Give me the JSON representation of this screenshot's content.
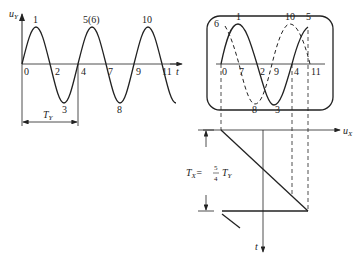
{
  "diagram": {
    "type": "oscilloscope-waveform-display",
    "left_plot": {
      "y_axis_label": "u",
      "y_axis_sub": "Y",
      "x_axis_label": "t",
      "peak_labels": [
        "1",
        "5(6)",
        "10"
      ],
      "trough_labels": [
        "3",
        "8"
      ],
      "zero_labels": [
        "0",
        "2",
        "4",
        "7",
        "9",
        "11"
      ],
      "period_label": "T",
      "period_sub": "Y"
    },
    "screen": {
      "solid_labels_top": [
        "1",
        "5"
      ],
      "dashed_labels_top": [
        "6",
        "10"
      ],
      "axis_labels": [
        "0",
        "7",
        "2",
        "9",
        "4",
        "11"
      ],
      "bottom_labels": [
        "8",
        "3"
      ]
    },
    "sweep": {
      "x_axis_label": "u",
      "x_axis_sub": "X",
      "t_axis_label": "t",
      "formula": {
        "lhs": "T",
        "lhs_sub": "X",
        "eq": "=",
        "num": "5",
        "den": "4",
        "rhs": "T",
        "rhs_sub": "Y"
      }
    },
    "colors": {
      "line": "#222222",
      "background": "#ffffff"
    }
  }
}
